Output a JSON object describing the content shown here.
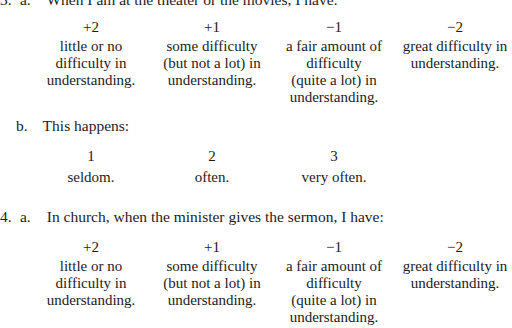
{
  "q3": {
    "a": {
      "number": "3.",
      "sub": "a.",
      "prompt": "When I am at the theater or the movies, I have:",
      "options": [
        {
          "value": "+2",
          "lines": [
            "little or no",
            "difficulty in",
            "understanding."
          ]
        },
        {
          "value": "+1",
          "lines": [
            "some difficulty",
            "(but not a lot) in",
            "understanding."
          ]
        },
        {
          "value": "−1",
          "lines": [
            "a fair amount of",
            "difficulty",
            "(quite a lot) in",
            "understanding."
          ]
        },
        {
          "value": "−2",
          "lines": [
            "great difficulty in",
            "understanding."
          ]
        }
      ]
    },
    "b": {
      "sub": "b.",
      "prompt": "This happens:",
      "options": [
        {
          "value": "1",
          "label": "seldom."
        },
        {
          "value": "2",
          "label": "often."
        },
        {
          "value": "3",
          "label": "very often."
        }
      ]
    }
  },
  "q4": {
    "a": {
      "number": "4.",
      "sub": "a.",
      "prompt": "In church, when the minister gives the sermon, I have:",
      "options": [
        {
          "value": "+2",
          "lines": [
            "little or no",
            "difficulty in",
            "understanding."
          ]
        },
        {
          "value": "+1",
          "lines": [
            "some difficulty",
            "(but not a lot) in",
            "understanding."
          ]
        },
        {
          "value": "−1",
          "lines": [
            "a fair amount of",
            "difficulty",
            "(quite a lot) in",
            "understanding."
          ]
        },
        {
          "value": "−2",
          "lines": [
            "great difficulty in",
            "understanding."
          ]
        }
      ]
    }
  }
}
